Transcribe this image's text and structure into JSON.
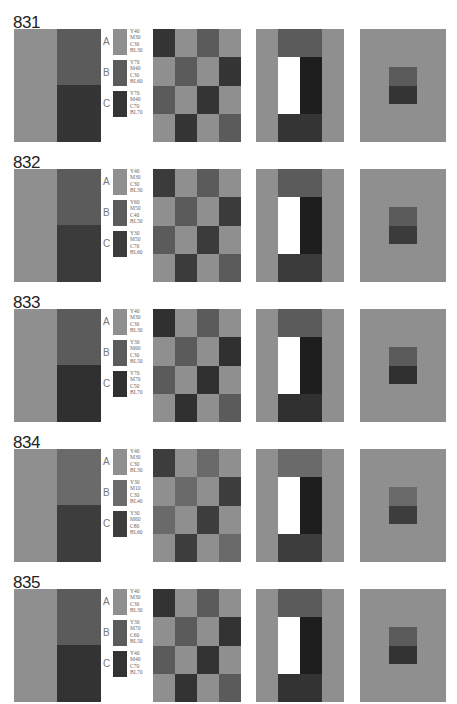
{
  "colors": {
    "light": "#8f8f8f",
    "mid": "#5b5b5b",
    "dark": "#353535",
    "black": "#1e1e1e",
    "white": "#ffffff"
  },
  "rows": [
    {
      "id": "831",
      "top": 14,
      "swatches": [
        {
          "letter": "A",
          "spec": "Y40\nM30\nC30\nBL30",
          "color": "#8f8f8f"
        },
        {
          "letter": "B",
          "spec": "Y70\nM40\nC30\nBL60",
          "color": "#5b5b5b"
        },
        {
          "letter": "C",
          "spec": "Y70\nM40\nC70\nBL70",
          "color": "#353535"
        }
      ]
    },
    {
      "id": "832",
      "top": 154,
      "swatches": [
        {
          "letter": "A",
          "spec": "Y40\nM30\nC30\nBL30",
          "color": "#8f8f8f"
        },
        {
          "letter": "B",
          "spec": "Y60\nM50\nC40\nBL50",
          "color": "#5b5b5b"
        },
        {
          "letter": "C",
          "spec": "Y30\nM50\nC70\nBL60",
          "color": "#3b3b3b"
        }
      ]
    },
    {
      "id": "833",
      "top": 294,
      "swatches": [
        {
          "letter": "A",
          "spec": "Y40\nM30\nC30\nBL30",
          "color": "#8f8f8f"
        },
        {
          "letter": "B",
          "spec": "Y30\nM60\nC30\nBL50",
          "color": "#5b5b5b"
        },
        {
          "letter": "C",
          "spec": "Y70\nM70\nC50\nBL70",
          "color": "#303030"
        }
      ]
    },
    {
      "id": "834",
      "top": 434,
      "swatches": [
        {
          "letter": "A",
          "spec": "Y40\nM30\nC30\nBL30",
          "color": "#8f8f8f"
        },
        {
          "letter": "B",
          "spec": "Y30\nM10\nC30\nBL40",
          "color": "#6a6a6a"
        },
        {
          "letter": "C",
          "spec": "Y30\nM60\nC80\nBL60",
          "color": "#3d3d3d"
        }
      ]
    },
    {
      "id": "835",
      "top": 574,
      "swatches": [
        {
          "letter": "A",
          "spec": "Y40\nM30\nC30\nBL30",
          "color": "#8f8f8f"
        },
        {
          "letter": "B",
          "spec": "Y30\nM70\nC60\nBL50",
          "color": "#5b5b5b"
        },
        {
          "letter": "C",
          "spec": "Y40\nM40\nC70\nBL70",
          "color": "#333333"
        }
      ]
    }
  ],
  "checker_pattern": [
    [
      "C",
      "A",
      "B",
      "A"
    ],
    [
      "A",
      "B",
      "A",
      "C"
    ],
    [
      "B",
      "A",
      "C",
      "A"
    ],
    [
      "A",
      "C",
      "A",
      "B"
    ]
  ]
}
